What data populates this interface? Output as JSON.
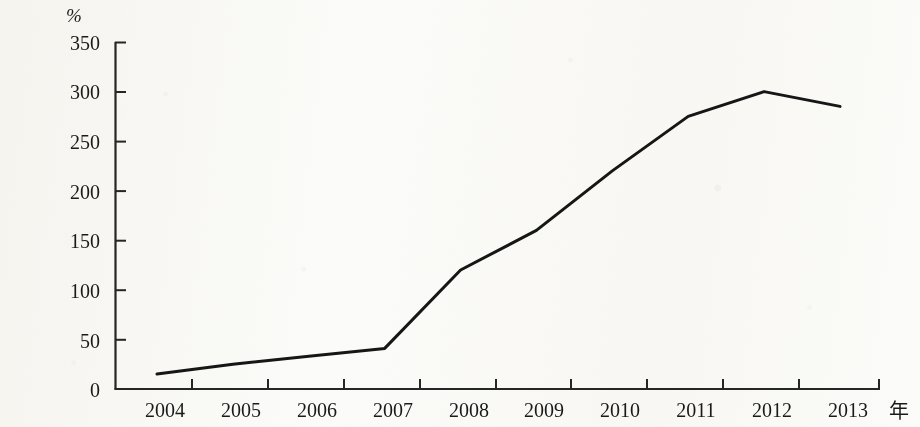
{
  "chart_data": {
    "type": "line",
    "title": "",
    "subtitle": "",
    "xlabel": "年",
    "ylabel": "%",
    "categories": [
      "2004",
      "2005",
      "2006",
      "2007",
      "2008",
      "2009",
      "2010",
      "2011",
      "2012",
      "2013"
    ],
    "values": [
      15,
      25,
      33,
      41,
      120,
      160,
      220,
      275,
      300,
      285
    ],
    "series": [
      {
        "name": "",
        "values": [
          15,
          25,
          33,
          41,
          120,
          160,
          220,
          275,
          300,
          285
        ]
      }
    ],
    "ylim": [
      0,
      350
    ],
    "yticks": [
      0,
      50,
      100,
      150,
      200,
      250,
      300,
      350
    ],
    "ytick_labels": [
      "0",
      "50",
      "100",
      "150",
      "200",
      "250",
      "300",
      "350"
    ],
    "xtick_labels": [
      "2004",
      "2005",
      "2006",
      "2007",
      "2008",
      "2009",
      "2010",
      "2011",
      "2012",
      "2013"
    ],
    "grid": false,
    "legend": false,
    "legend_position": "none",
    "line_color": "#161616",
    "axis_color": "#2b2b2b",
    "background_color": "#fbfbf9"
  },
  "axes": {
    "y_unit": "%",
    "x_unit": "年"
  }
}
